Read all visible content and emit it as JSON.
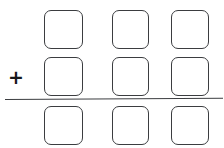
{
  "worksheet": {
    "title": "Vertical Addition Worksheet Template",
    "background_color": "#ffffff",
    "ink_color": "#3b3d40",
    "width": 224,
    "height": 148,
    "operator": {
      "symbol": "+",
      "name": "plus",
      "color": "#17181a"
    },
    "answer_rule": {
      "label": "",
      "color": "#3b3d40"
    },
    "grid": {
      "columns": 3,
      "rows": 3,
      "column_labels": [
        "hundreds",
        "tens",
        "ones"
      ],
      "row_labels": [
        "addend-1",
        "addend-2",
        "sum"
      ],
      "cells": [
        {
          "row": "addend-1",
          "column": "hundreds",
          "value": ""
        },
        {
          "row": "addend-1",
          "column": "tens",
          "value": ""
        },
        {
          "row": "addend-1",
          "column": "ones",
          "value": ""
        },
        {
          "row": "addend-2",
          "column": "hundreds",
          "value": ""
        },
        {
          "row": "addend-2",
          "column": "tens",
          "value": ""
        },
        {
          "row": "addend-2",
          "column": "ones",
          "value": ""
        },
        {
          "row": "sum",
          "column": "hundreds",
          "value": ""
        },
        {
          "row": "sum",
          "column": "tens",
          "value": ""
        },
        {
          "row": "sum",
          "column": "ones",
          "value": ""
        }
      ]
    }
  }
}
